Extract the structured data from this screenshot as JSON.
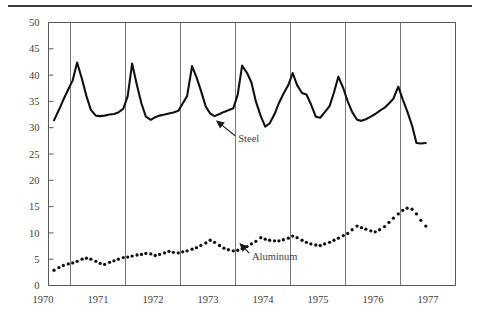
{
  "figure": {
    "background_color": "#ffffff",
    "ink_color": "#111111",
    "axis_color": "#595959",
    "top_rule": true
  },
  "chart_data": {
    "type": "line",
    "title": "",
    "subtitle": "",
    "xlabel": "",
    "ylabel": "",
    "xlim": [
      1969.6,
      1977.0
    ],
    "ylim": [
      0,
      50
    ],
    "grid": "vertical-year-boundaries",
    "legend": "inline-annotations",
    "y_ticks": [
      0,
      5,
      10,
      15,
      20,
      25,
      30,
      35,
      40,
      45,
      50
    ],
    "y_tick_labels": [
      "0",
      "5",
      "10",
      "15",
      "20",
      "25",
      "30",
      "35",
      "40",
      "45",
      "50"
    ],
    "x_tick_labels": [
      "1970",
      "1971",
      "1972",
      "1973",
      "1974",
      "1975",
      "1976",
      "1977"
    ],
    "x_year_boundaries": [
      1970.0,
      1971.0,
      1972.0,
      1973.0,
      1974.0,
      1975.0,
      1976.0,
      1977.0
    ],
    "annotations": [
      {
        "text": "Steel",
        "x": 1973.05,
        "y": 28.0,
        "arrow_to_x": 1972.62,
        "arrow_to_y": 31.6
      },
      {
        "text": "Aluminum",
        "x": 1973.3,
        "y": 5.6,
        "arrow_to_x": 1973.05,
        "arrow_to_y": 8.3
      }
    ],
    "series": [
      {
        "name": "Steel",
        "style": "solid-line",
        "color": "#111111",
        "x": [
          1969.7,
          1969.79,
          1969.87,
          1969.96,
          1970.04,
          1970.12,
          1970.21,
          1970.29,
          1970.37,
          1970.46,
          1970.54,
          1970.62,
          1970.71,
          1970.79,
          1970.87,
          1970.96,
          1971.04,
          1971.12,
          1971.21,
          1971.29,
          1971.37,
          1971.46,
          1971.54,
          1971.62,
          1971.71,
          1971.79,
          1971.87,
          1971.96,
          1972.04,
          1972.12,
          1972.21,
          1972.29,
          1972.37,
          1972.46,
          1972.54,
          1972.62,
          1972.71,
          1972.79,
          1972.87,
          1972.96,
          1973.04,
          1973.12,
          1973.21,
          1973.29,
          1973.37,
          1973.46,
          1973.54,
          1973.62,
          1973.71,
          1973.79,
          1973.87,
          1973.96,
          1974.04,
          1974.12,
          1974.21,
          1974.29,
          1974.37,
          1974.46,
          1974.54,
          1974.62,
          1974.71,
          1974.79,
          1974.87,
          1974.96,
          1975.04,
          1975.12,
          1975.21,
          1975.29,
          1975.37,
          1975.46,
          1975.54,
          1975.62,
          1975.71,
          1975.79,
          1975.87,
          1975.96,
          1976.04,
          1976.12,
          1976.21,
          1976.29,
          1976.37,
          1976.46
        ],
        "y": [
          31.4,
          33.4,
          35.3,
          37.3,
          39.0,
          42.4,
          39.2,
          36.0,
          33.4,
          32.3,
          32.2,
          32.3,
          32.5,
          32.6,
          32.9,
          33.6,
          36.0,
          42.2,
          38.0,
          34.6,
          32.1,
          31.5,
          32.0,
          32.3,
          32.5,
          32.7,
          32.9,
          33.2,
          34.6,
          36.0,
          41.7,
          39.6,
          37.1,
          34.0,
          32.7,
          32.2,
          32.6,
          33.0,
          33.3,
          33.7,
          36.3,
          41.8,
          40.4,
          38.6,
          35.0,
          32.2,
          30.2,
          30.8,
          32.6,
          34.7,
          36.4,
          38.1,
          40.4,
          38.1,
          36.6,
          36.3,
          34.5,
          32.1,
          31.9,
          32.9,
          34.1,
          36.7,
          39.7,
          37.5,
          35.0,
          33.0,
          31.5,
          31.3,
          31.6,
          32.1,
          32.6,
          33.2,
          33.8,
          34.6,
          35.5,
          37.8,
          35.4,
          33.2,
          30.4,
          27.1,
          27.0,
          27.1
        ]
      },
      {
        "name": "Aluminum",
        "style": "dotted",
        "color": "#111111",
        "x": [
          1969.7,
          1969.79,
          1969.87,
          1969.96,
          1970.04,
          1970.12,
          1970.21,
          1970.29,
          1970.37,
          1970.46,
          1970.54,
          1970.62,
          1970.71,
          1970.79,
          1970.87,
          1970.96,
          1971.04,
          1971.12,
          1971.21,
          1971.29,
          1971.37,
          1971.46,
          1971.54,
          1971.62,
          1971.71,
          1971.79,
          1971.87,
          1971.96,
          1972.04,
          1972.12,
          1972.21,
          1972.29,
          1972.37,
          1972.46,
          1972.54,
          1972.62,
          1972.71,
          1972.79,
          1972.87,
          1972.96,
          1973.04,
          1973.12,
          1973.21,
          1973.29,
          1973.37,
          1973.46,
          1973.54,
          1973.62,
          1973.71,
          1973.79,
          1973.87,
          1973.96,
          1974.04,
          1974.12,
          1974.21,
          1974.29,
          1974.37,
          1974.46,
          1974.54,
          1974.62,
          1974.71,
          1974.79,
          1974.87,
          1974.96,
          1975.04,
          1975.12,
          1975.21,
          1975.29,
          1975.37,
          1975.46,
          1975.54,
          1975.62,
          1975.71,
          1975.79,
          1975.87,
          1975.96,
          1976.04,
          1976.12,
          1976.21,
          1976.29,
          1976.37,
          1976.46
        ],
        "y": [
          2.9,
          3.4,
          3.8,
          4.1,
          4.3,
          4.6,
          5.0,
          5.2,
          5.0,
          4.6,
          4.2,
          4.0,
          4.4,
          4.7,
          5.0,
          5.3,
          5.4,
          5.6,
          5.8,
          5.9,
          6.1,
          6.0,
          5.7,
          5.9,
          6.2,
          6.5,
          6.3,
          6.2,
          6.4,
          6.6,
          6.9,
          7.2,
          7.6,
          8.1,
          8.6,
          8.2,
          7.6,
          7.1,
          6.8,
          6.6,
          6.7,
          7.0,
          7.4,
          7.9,
          8.4,
          9.1,
          8.8,
          8.6,
          8.5,
          8.5,
          8.7,
          9.0,
          9.4,
          9.1,
          8.6,
          8.2,
          7.9,
          7.7,
          7.6,
          7.9,
          8.2,
          8.6,
          9.0,
          9.5,
          9.9,
          10.6,
          11.3,
          11.0,
          10.7,
          10.4,
          10.2,
          10.6,
          11.2,
          12.0,
          12.8,
          13.6,
          14.3,
          14.7,
          14.5,
          13.6,
          12.4,
          11.3
        ]
      }
    ]
  }
}
